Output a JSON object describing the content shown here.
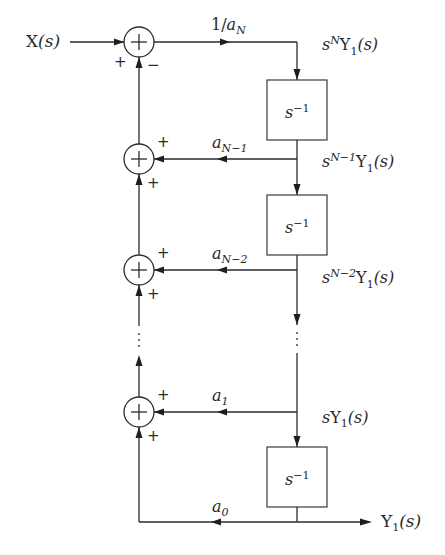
{
  "diagram": {
    "type": "block-diagram",
    "input": {
      "label": "X",
      "arg": "(s)"
    },
    "output": {
      "label": "Y",
      "sub": "1",
      "arg": "(s)"
    },
    "gain_top": {
      "prefix": "1/",
      "var": "a",
      "sub": "N"
    },
    "signals": [
      {
        "id": "sN",
        "s": "s",
        "sup": "N",
        "Y": "Y",
        "sub": "1",
        "arg": "(s)"
      },
      {
        "id": "sN1",
        "s": "s",
        "sup": "N−1",
        "Y": "Y",
        "sub": "1",
        "arg": "(s)"
      },
      {
        "id": "sN2",
        "s": "s",
        "sup": "N−2",
        "Y": "Y",
        "sub": "1",
        "arg": "(s)"
      },
      {
        "id": "s1",
        "s": "s",
        "sup": "",
        "Y": "Y",
        "sub": "1",
        "arg": "(s)"
      }
    ],
    "delay_blocks": [
      {
        "base": "s",
        "exp": "−1"
      },
      {
        "base": "s",
        "exp": "−1"
      },
      {
        "base": "s",
        "exp": "−1"
      }
    ],
    "feedback_gains": [
      {
        "var": "a",
        "sub": "N−1"
      },
      {
        "var": "a",
        "sub": "N−2"
      },
      {
        "var": "a",
        "sub": "1"
      },
      {
        "var": "a",
        "sub": "0"
      }
    ],
    "summers": [
      {
        "symbol": "+",
        "sign_left": "+",
        "sign_bottom": "−"
      },
      {
        "symbol": "+",
        "sign_right": "+",
        "sign_bottom": "+"
      },
      {
        "symbol": "+",
        "sign_right": "+",
        "sign_bottom": "+"
      },
      {
        "symbol": "+",
        "sign_right": "+",
        "sign_bottom": "+"
      }
    ],
    "ellipsis": "⋮"
  }
}
